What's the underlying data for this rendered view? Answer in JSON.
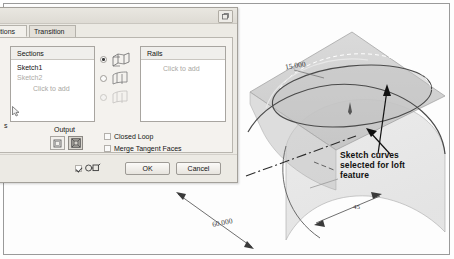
{
  "document": {
    "title": "Loft dialog over 3D sketch viewport"
  },
  "dialog": {
    "title_button_icon": "restore-icon",
    "tabs": [
      {
        "label": "Conditions",
        "active": true,
        "name": "tab-conditions"
      },
      {
        "label": "Transition",
        "active": false,
        "name": "tab-transition"
      }
    ],
    "sections_list": {
      "header": "Sections",
      "items": [
        {
          "label": "Sketch1",
          "state": "selected"
        },
        {
          "label": "Sketch2",
          "state": "dimmed"
        }
      ],
      "add_hint": "Click to add"
    },
    "rails_list": {
      "header": "Rails",
      "items": [],
      "add_hint": "Click to add"
    },
    "loft_type_options": [
      {
        "icon": "loft-rail-icon",
        "selected": true,
        "enabled": true
      },
      {
        "icon": "loft-center-icon",
        "selected": false,
        "enabled": true
      },
      {
        "icon": "loft-area-icon",
        "selected": false,
        "enabled": false
      }
    ],
    "output": {
      "label": "Output",
      "buttons": [
        {
          "icon": "surface-output-icon",
          "pressed": false
        },
        {
          "icon": "solid-output-icon",
          "pressed": true
        }
      ]
    },
    "checkboxes": [
      {
        "label": "Closed Loop",
        "checked": false
      },
      {
        "label": "Merge Tangent Faces",
        "checked": false
      }
    ],
    "footer": {
      "preview_checked": true,
      "preview_icon": "preview-glasses-icon",
      "ok_label": "OK",
      "cancel_label": "Cancel"
    }
  },
  "left_stub": {
    "text": "s"
  },
  "viewport": {
    "annotation": {
      "line1": "Sketch curves",
      "line2": "selected for loft",
      "line3": "feature"
    },
    "dimensions": [
      {
        "name": "height-dimension",
        "value": "15.000"
      },
      {
        "name": "length-dimension",
        "value": "60.000"
      },
      {
        "name": "width-dimension",
        "value": "45"
      }
    ],
    "colors": {
      "plane_fill": "#c9c9c9",
      "surface_fill": "#d6d6d6",
      "curve_stroke": "#4a4a4a",
      "annotation_text": "#111111"
    }
  }
}
